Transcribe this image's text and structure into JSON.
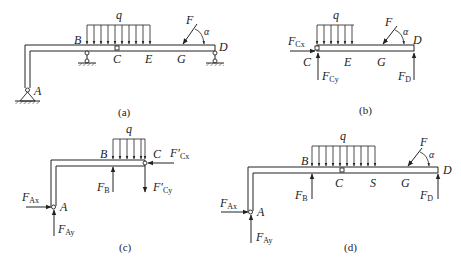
{
  "figures": [
    {
      "id": "a",
      "caption": "(a)",
      "labels": {
        "q": "q",
        "F": "F",
        "alpha": "α",
        "A": "A",
        "B": "B",
        "C": "C",
        "D": "D",
        "E": "E",
        "G": "G"
      }
    },
    {
      "id": "b",
      "caption": "(b)",
      "labels": {
        "q": "q",
        "F": "F",
        "alpha": "α",
        "C": "C",
        "D": "D",
        "E": "E",
        "G": "G",
        "FCx_main": "F",
        "FCx_sub": "Cx",
        "FCy_main": "F",
        "FCy_sub": "Cy",
        "FD_main": "F",
        "FD_sub": "D"
      }
    },
    {
      "id": "c",
      "caption": "(c)",
      "labels": {
        "q": "q",
        "A": "A",
        "B": "B",
        "C": "C",
        "FCx_main": "F′",
        "FCx_sub": "Cx",
        "FCy_main": "F′",
        "FCy_sub": "Cy",
        "FB_main": "F",
        "FB_sub": "B",
        "FAx_main": "F",
        "FAx_sub": "Ax",
        "FAy_main": "F",
        "FAy_sub": "Ay"
      }
    },
    {
      "id": "d",
      "caption": "(d)",
      "labels": {
        "q": "q",
        "F": "F",
        "alpha": "α",
        "A": "A",
        "B": "B",
        "C": "C",
        "S": "S",
        "G": "G",
        "D": "D",
        "FB_main": "F",
        "FB_sub": "B",
        "FD_main": "F",
        "FD_sub": "D",
        "FAx_main": "F",
        "FAx_sub": "Ax",
        "FAy_main": "F",
        "FAy_sub": "Ay"
      }
    }
  ],
  "colors": {
    "line": "#222222",
    "background": "#ffffff"
  }
}
